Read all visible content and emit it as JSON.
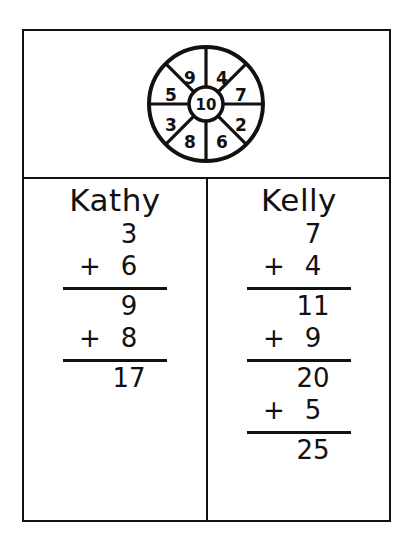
{
  "worksheet": {
    "title": "Spinner addition worksheet",
    "spinner": {
      "name": "spinner-wheel",
      "center_value": "10",
      "segments": [
        {
          "label": "9",
          "position": "upper-left"
        },
        {
          "label": "4",
          "position": "upper-right"
        },
        {
          "label": "7",
          "position": "right-upper"
        },
        {
          "label": "2",
          "position": "right-lower"
        },
        {
          "label": "6",
          "position": "lower-right"
        },
        {
          "label": "8",
          "position": "lower-left"
        },
        {
          "label": "3",
          "position": "left-lower"
        },
        {
          "label": "5",
          "position": "left-upper"
        }
      ]
    },
    "columns": [
      {
        "name": "kathy",
        "title": "Kathy",
        "rows": [
          {
            "op": "",
            "num": "3",
            "rule_after": false
          },
          {
            "op": "+",
            "num": "6",
            "rule_after": true
          },
          {
            "op": "",
            "num": "9",
            "rule_after": false
          },
          {
            "op": "+",
            "num": "8",
            "rule_after": true
          },
          {
            "op": "",
            "num": "17",
            "rule_after": false
          }
        ]
      },
      {
        "name": "kelly",
        "title": "Kelly",
        "rows": [
          {
            "op": "",
            "num": "7",
            "rule_after": false
          },
          {
            "op": "+",
            "num": "4",
            "rule_after": true
          },
          {
            "op": "",
            "num": "11",
            "rule_after": false
          },
          {
            "op": "+",
            "num": "9",
            "rule_after": true
          },
          {
            "op": "",
            "num": "20",
            "rule_after": false
          },
          {
            "op": "+",
            "num": "5",
            "rule_after": true
          },
          {
            "op": "",
            "num": "25",
            "rule_after": false
          }
        ]
      }
    ],
    "colors": {
      "ink": "#111111",
      "paper": "#ffffff"
    }
  }
}
